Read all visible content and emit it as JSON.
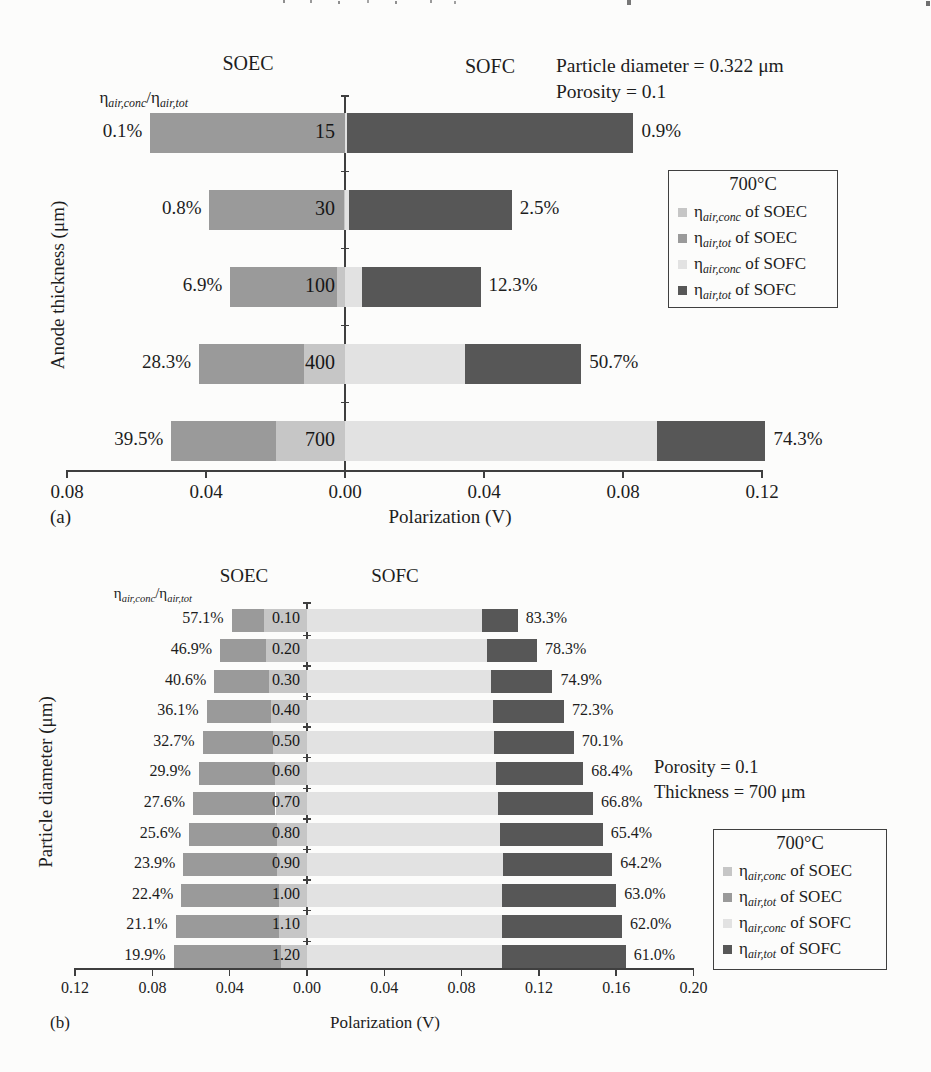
{
  "page": {
    "background": "#fcfcfb"
  },
  "chart_data": [
    {
      "panel_label": "(a)",
      "type": "bar",
      "subtype": "diverging-stacked-horizontal",
      "left_header": "SOEC",
      "right_header": "SOFC",
      "annotations": [
        "Particle diameter = 0.322 μm",
        "Porosity = 0.1"
      ],
      "ratio_header": {
        "eta": "η",
        "num": "air,conc",
        "sep": "/",
        "den": "air,tot"
      },
      "xlabel": "Polarization (V)",
      "ylabel": "Anode thickness (μm)",
      "xlim": [
        -0.08,
        0.125
      ],
      "tick_values": [
        -0.08,
        -0.04,
        0,
        0.04,
        0.08,
        0.12
      ],
      "tick_labels": [
        "0.08",
        "0.04",
        "0.00",
        "0.04",
        "0.08",
        "0.12"
      ],
      "categories": [
        "15",
        "30",
        "100",
        "400",
        "700"
      ],
      "soec": {
        "tot": [
          0.056,
          0.039,
          0.033,
          0.042,
          0.05
        ],
        "conc": [
          0.0001,
          0.0003,
          0.0023,
          0.0119,
          0.0198
        ],
        "pct_labels": [
          "0.1%",
          "0.8%",
          "6.9%",
          "28.3%",
          "39.5%"
        ]
      },
      "sofc": {
        "tot": [
          0.083,
          0.048,
          0.039,
          0.068,
          0.121
        ],
        "conc": [
          0.0007,
          0.0012,
          0.0048,
          0.0345,
          0.0899
        ],
        "pct_labels": [
          "0.9%",
          "2.5%",
          "12.3%",
          "50.7%",
          "74.3%"
        ]
      },
      "legend": {
        "title": "700°C",
        "eta": "η",
        "entries": [
          {
            "sub": "air,conc",
            "rest": " of SOEC",
            "color_key": "soec_conc"
          },
          {
            "sub": "air,tot",
            "rest": " of SOEC",
            "color_key": "soec_tot"
          },
          {
            "sub": "air,conc",
            "rest": " of SOFC",
            "color_key": "sofc_conc"
          },
          {
            "sub": "air,tot",
            "rest": " of SOFC",
            "color_key": "sofc_tot"
          }
        ]
      },
      "colors": {
        "soec_conc": "#c6c6c6",
        "soec_tot": "#9a9a9a",
        "sofc_conc": "#e2e2e2",
        "sofc_tot": "#575757"
      }
    },
    {
      "panel_label": "(b)",
      "type": "bar",
      "subtype": "diverging-stacked-horizontal",
      "left_header": "SOEC",
      "right_header": "SOFC",
      "annotations": [
        "Porosity = 0.1",
        "Thickness = 700 μm"
      ],
      "ratio_header": {
        "eta": "η",
        "num": "air,conc",
        "sep": "/",
        "den": "air,tot"
      },
      "xlabel": "Polarization (V)",
      "ylabel": "Particle diameter (μm)",
      "xlim": [
        -0.12,
        0.2
      ],
      "tick_values": [
        -0.12,
        -0.08,
        -0.04,
        0,
        0.04,
        0.08,
        0.12,
        0.16,
        0.2
      ],
      "tick_labels": [
        "0.12",
        "0.08",
        "0.04",
        "0.00",
        "0.04",
        "0.08",
        "0.12",
        "0.16",
        "0.20"
      ],
      "categories": [
        "0.10",
        "0.20",
        "0.30",
        "0.40",
        "0.50",
        "0.60",
        "0.70",
        "0.80",
        "0.90",
        "1.00",
        "1.10",
        "1.20"
      ],
      "soec": {
        "tot": [
          0.039,
          0.045,
          0.048,
          0.052,
          0.054,
          0.056,
          0.059,
          0.061,
          0.064,
          0.065,
          0.068,
          0.069
        ],
        "conc": [
          0.0223,
          0.0211,
          0.0195,
          0.0188,
          0.0177,
          0.0167,
          0.0163,
          0.0156,
          0.0153,
          0.0146,
          0.0143,
          0.0137
        ],
        "pct_labels": [
          "57.1%",
          "46.9%",
          "40.6%",
          "36.1%",
          "32.7%",
          "29.9%",
          "27.6%",
          "25.6%",
          "23.9%",
          "22.4%",
          "21.1%",
          "19.9%"
        ]
      },
      "sofc": {
        "tot": [
          0.109,
          0.119,
          0.127,
          0.133,
          0.138,
          0.143,
          0.148,
          0.153,
          0.158,
          0.16,
          0.163,
          0.165
        ],
        "conc": [
          0.0908,
          0.0932,
          0.0951,
          0.0962,
          0.0967,
          0.0978,
          0.0989,
          0.1001,
          0.1014,
          0.1008,
          0.1011,
          0.1007
        ],
        "pct_labels": [
          "83.3%",
          "78.3%",
          "74.9%",
          "72.3%",
          "70.1%",
          "68.4%",
          "66.8%",
          "65.4%",
          "64.2%",
          "63.0%",
          "62.0%",
          "61.0%"
        ]
      },
      "legend": {
        "title": "700°C",
        "eta": "η",
        "entries": [
          {
            "sub": "air,conc",
            "rest": " of SOEC",
            "color_key": "soec_conc"
          },
          {
            "sub": "air,tot",
            "rest": " of SOEC",
            "color_key": "soec_tot"
          },
          {
            "sub": "air,conc",
            "rest": " of SOFC",
            "color_key": "sofc_conc"
          },
          {
            "sub": "air,tot",
            "rest": " of SOFC",
            "color_key": "sofc_tot"
          }
        ]
      },
      "colors": {
        "soec_conc": "#c6c6c6",
        "soec_tot": "#9a9a9a",
        "sofc_conc": "#e2e2e2",
        "sofc_tot": "#575757"
      }
    }
  ]
}
